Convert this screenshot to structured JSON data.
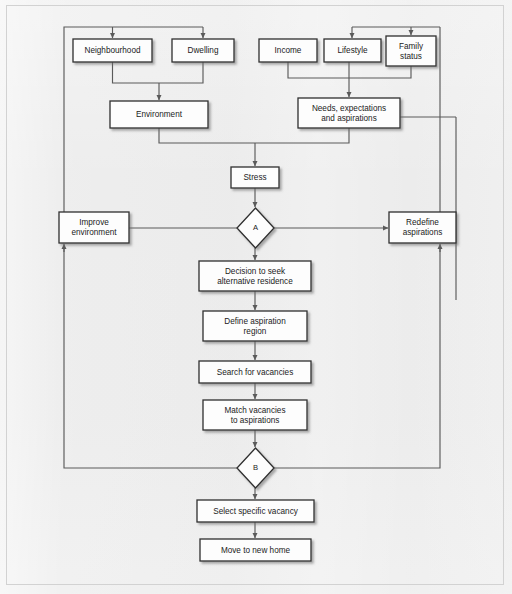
{
  "figure": {
    "type": "flowchart",
    "frame_color": "#d2d2d2",
    "background_color": "#e9e9e9",
    "box_fill": "#fdfdfd",
    "box_border_color": "#2f2f2f",
    "connector_color": "#5a5a5a"
  },
  "nodes": [
    {
      "id": "neighbourhood",
      "label": "Neighbourhood",
      "shape": "box",
      "x": 73,
      "y": 39,
      "w": 79,
      "h": 23
    },
    {
      "id": "dwelling",
      "label": "Dwelling",
      "shape": "box",
      "x": 172,
      "y": 39,
      "w": 62,
      "h": 23
    },
    {
      "id": "income",
      "label": "Income",
      "shape": "box",
      "x": 259,
      "y": 39,
      "w": 58,
      "h": 23
    },
    {
      "id": "lifestyle",
      "label": "Lifestyle",
      "shape": "box",
      "x": 324,
      "y": 39,
      "w": 57,
      "h": 23
    },
    {
      "id": "family_status",
      "label": "Family\nstatus",
      "shape": "box",
      "x": 386,
      "y": 36,
      "w": 50,
      "h": 30
    },
    {
      "id": "environment",
      "label": "Environment",
      "shape": "box",
      "x": 110,
      "y": 101,
      "w": 98,
      "h": 27
    },
    {
      "id": "needs",
      "label": "Needs, expectations\nand aspirations",
      "shape": "box",
      "x": 298,
      "y": 98,
      "w": 102,
      "h": 30
    },
    {
      "id": "stress",
      "label": "Stress",
      "shape": "box",
      "x": 231,
      "y": 167,
      "w": 48,
      "h": 21
    },
    {
      "id": "decision_a",
      "label": "A",
      "shape": "diamond",
      "x": 237,
      "y": 208,
      "w": 37,
      "h": 40
    },
    {
      "id": "improve_environment",
      "label": "Improve\nenvironment",
      "shape": "box",
      "x": 59,
      "y": 212,
      "w": 70,
      "h": 31
    },
    {
      "id": "redefine_aspirations",
      "label": "Redefine\naspirations",
      "shape": "box",
      "x": 389,
      "y": 212,
      "w": 67,
      "h": 31
    },
    {
      "id": "decision_to_seek",
      "label": "Decision to seek\nalternative residence",
      "shape": "box",
      "x": 199,
      "y": 261,
      "w": 112,
      "h": 30
    },
    {
      "id": "define_region",
      "label": "Define aspiration\nregion",
      "shape": "box",
      "x": 203,
      "y": 311,
      "w": 104,
      "h": 30
    },
    {
      "id": "search_vacancies",
      "label": "Search for vacancies",
      "shape": "box",
      "x": 199,
      "y": 361,
      "w": 112,
      "h": 22
    },
    {
      "id": "match_vacancies",
      "label": "Match vacancies\nto aspirations",
      "shape": "box",
      "x": 203,
      "y": 400,
      "w": 104,
      "h": 30
    },
    {
      "id": "decision_b",
      "label": "B",
      "shape": "diamond",
      "x": 237,
      "y": 448,
      "w": 37,
      "h": 40
    },
    {
      "id": "select_vacancy",
      "label": "Select specific vacancy",
      "shape": "box",
      "x": 197,
      "y": 500,
      "w": 117,
      "h": 22
    },
    {
      "id": "move_home",
      "label": "Move to new home",
      "shape": "box",
      "x": 200,
      "y": 539,
      "w": 111,
      "h": 22
    }
  ],
  "edges": [
    {
      "id": "e-loop-top-to-neighbourhood",
      "from": "improve_environment",
      "to": "neighbourhood",
      "arrow": true
    },
    {
      "id": "e-loop-top-to-dwelling",
      "from": "improve_environment",
      "to": "dwelling",
      "arrow": true
    },
    {
      "id": "e-neighbourhood-to-environment",
      "from": "neighbourhood",
      "to": "environment",
      "arrow": true
    },
    {
      "id": "e-dwelling-to-environment",
      "from": "dwelling",
      "to": "environment",
      "arrow": true
    },
    {
      "id": "e-income-to-needs",
      "from": "income",
      "to": "needs",
      "arrow": true
    },
    {
      "id": "e-lifestyle-to-needs",
      "from": "lifestyle",
      "to": "needs",
      "arrow": true
    },
    {
      "id": "e-family-to-needs",
      "from": "family_status",
      "to": "needs",
      "arrow": true
    },
    {
      "id": "e-environment-to-stress",
      "from": "environment",
      "to": "stress",
      "arrow": true
    },
    {
      "id": "e-needs-to-stress",
      "from": "needs",
      "to": "stress",
      "arrow": true
    },
    {
      "id": "e-stress-to-a",
      "from": "stress",
      "to": "decision_a",
      "arrow": true
    },
    {
      "id": "e-a-to-improve",
      "from": "decision_a",
      "to": "improve_environment",
      "arrow": false
    },
    {
      "id": "e-a-to-redefine",
      "from": "decision_a",
      "to": "redefine_aspirations",
      "arrow": true
    },
    {
      "id": "e-a-to-decision-seek",
      "from": "decision_a",
      "to": "decision_to_seek",
      "arrow": true
    },
    {
      "id": "e-seek-to-define",
      "from": "decision_to_seek",
      "to": "define_region",
      "arrow": true
    },
    {
      "id": "e-define-to-search",
      "from": "define_region",
      "to": "search_vacancies",
      "arrow": true
    },
    {
      "id": "e-search-to-match",
      "from": "search_vacancies",
      "to": "match_vacancies",
      "arrow": true
    },
    {
      "id": "e-match-to-b",
      "from": "match_vacancies",
      "to": "decision_b",
      "arrow": true
    },
    {
      "id": "e-b-to-improve-loop",
      "from": "decision_b",
      "to": "improve_environment",
      "arrow": true
    },
    {
      "id": "e-b-to-redefine-loop",
      "from": "decision_b",
      "to": "redefine_aspirations",
      "arrow": true
    },
    {
      "id": "e-b-to-select",
      "from": "decision_b",
      "to": "select_vacancy",
      "arrow": true
    },
    {
      "id": "e-select-to-move",
      "from": "select_vacancy",
      "to": "move_home",
      "arrow": true
    },
    {
      "id": "e-redefine-to-lifestyle",
      "from": "redefine_aspirations",
      "to": "lifestyle",
      "arrow": true
    },
    {
      "id": "e-redefine-to-family",
      "from": "redefine_aspirations",
      "to": "family_status",
      "arrow": true
    },
    {
      "id": "e-needs-to-right-rail",
      "from": "needs",
      "to": "redefine_aspirations",
      "arrow": false
    }
  ]
}
